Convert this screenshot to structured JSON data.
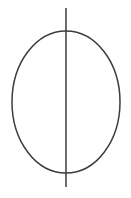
{
  "canvas": {
    "width": 131,
    "height": 198,
    "background_color": "#ffffff"
  },
  "style": {
    "stroke_color": "#3d3d3d",
    "stroke_width": 1.5,
    "fill": "none"
  },
  "diagram": {
    "type": "geometric-line-drawing",
    "shapes": [
      {
        "name": "ellipse-outline",
        "kind": "ellipse",
        "center_x": 66,
        "center_y": 102,
        "radius_x": 54,
        "radius_y": 71,
        "bounds": {
          "left": 12,
          "top": 31,
          "right": 120,
          "bottom": 173
        }
      },
      {
        "name": "vertical-axis-line",
        "kind": "line",
        "x1": 66,
        "y1": 8,
        "x2": 66,
        "y2": 187
      }
    ],
    "intersections": [
      {
        "name": "top-intersection",
        "x": 66,
        "y": 31
      },
      {
        "name": "bottom-intersection",
        "x": 66,
        "y": 173
      }
    ],
    "labels": []
  }
}
